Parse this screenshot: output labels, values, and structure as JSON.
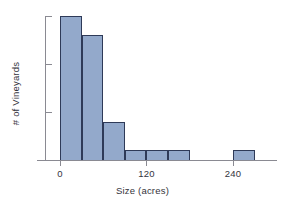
{
  "chart_data": {
    "type": "bar",
    "title": "",
    "xlabel": "Size (acres)",
    "ylabel": "# of Vineyards",
    "xlim": [
      -30,
      300
    ],
    "ylim": [
      0,
      16
    ],
    "grid": false,
    "legend": null,
    "bin_width": 30,
    "x_ticks": [
      {
        "value": 0,
        "label": "0"
      },
      {
        "value": 120,
        "label": "120"
      },
      {
        "value": 240,
        "label": "240"
      }
    ],
    "y_ticks": [
      {
        "value": 5,
        "label": "5"
      },
      {
        "value": 10,
        "label": "10"
      },
      {
        "value": 15,
        "label": "15"
      }
    ],
    "bins": [
      {
        "start": 0,
        "end": 30,
        "count": 15
      },
      {
        "start": 30,
        "end": 60,
        "count": 13
      },
      {
        "start": 60,
        "end": 90,
        "count": 4
      },
      {
        "start": 90,
        "end": 120,
        "count": 1
      },
      {
        "start": 120,
        "end": 150,
        "count": 1
      },
      {
        "start": 150,
        "end": 180,
        "count": 1
      },
      {
        "start": 180,
        "end": 210,
        "count": 0
      },
      {
        "start": 210,
        "end": 240,
        "count": 0
      },
      {
        "start": 240,
        "end": 270,
        "count": 1
      }
    ],
    "categories": [
      "0-30",
      "30-60",
      "60-90",
      "90-120",
      "120-150",
      "150-180",
      "180-210",
      "210-240",
      "240-270"
    ],
    "values": [
      15,
      13,
      4,
      1,
      1,
      1,
      0,
      0,
      1
    ],
    "colors": {
      "bar_fill": "#93a9cb",
      "bar_border": "#2e3a58",
      "axis": "#8a8a92",
      "text": "#34343c",
      "background": "#ffffff"
    }
  }
}
